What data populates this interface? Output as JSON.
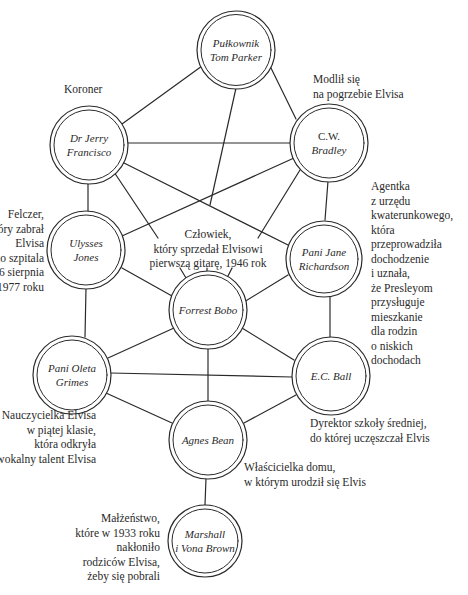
{
  "diagram": {
    "type": "network",
    "style": "hand-drawn double-circle nodes",
    "line_color": "#2a2a2a",
    "background": "#ffffff"
  },
  "nodes": {
    "parker": {
      "line1": "Pułkownik",
      "line2": "Tom Parker"
    },
    "francisco": {
      "line1": "Dr Jerry",
      "line2": "Francisco"
    },
    "bradley": {
      "line1": "C.W.",
      "line2": "Bradley"
    },
    "jones": {
      "line1": "Ulysses",
      "line2": "Jones"
    },
    "richardson": {
      "line1": "Pani Jane",
      "line2": "Richardson"
    },
    "bobo": {
      "line1": "Forrest Bobo"
    },
    "grimes": {
      "line1": "Pani Oleta",
      "line2": "Grimes"
    },
    "ball": {
      "line1": "E.C. Ball"
    },
    "bean": {
      "line1": "Agnes Bean"
    },
    "brown": {
      "line1": "Marshall",
      "line2": "i Vona Brown"
    }
  },
  "annotations": {
    "francisco": [
      "Koroner"
    ],
    "bradley": [
      "Modlił się",
      "na pogrzebie Elvisa"
    ],
    "richardson": [
      "Agentka",
      "z urzędu",
      "kwaterunkowego,",
      "która",
      "przeprowadziła",
      "dochodzenie",
      "i uznała,",
      "że Presleyom",
      "przysługuje",
      "mieszkanie",
      "dla rodzin",
      "o niskich",
      "dochodach"
    ],
    "jones": [
      "Felczer,",
      "który zabrał",
      "Elvisa",
      "do szpitala",
      "16 sierpnia",
      "1977 roku"
    ],
    "bobo": [
      "Człowiek,",
      "który sprzedał Elvisowi",
      "pierwszą gitarę, 1946 rok"
    ],
    "grimes": [
      "Nauczycielka Elvisa",
      "w piątej klasie,",
      "która odkryła",
      "wokalny talent Elvisa"
    ],
    "ball": [
      "Dyrektor szkoły średniej,",
      "do której uczęszczał Elvis"
    ],
    "bean": [
      "Właścicielka domu,",
      "w którym urodził się Elvis"
    ],
    "brown": [
      "Małżeństwo,",
      "które w 1933 roku",
      "nakłoniło",
      "rodziców Elvisa,",
      "żeby się pobrali"
    ]
  },
  "edges": [
    [
      "parker",
      "francisco"
    ],
    [
      "parker",
      "bradley"
    ],
    [
      "parker",
      "bobo"
    ],
    [
      "francisco",
      "bradley"
    ],
    [
      "francisco",
      "jones"
    ],
    [
      "francisco",
      "richardson"
    ],
    [
      "francisco",
      "bobo"
    ],
    [
      "bradley",
      "jones"
    ],
    [
      "bradley",
      "richardson"
    ],
    [
      "bradley",
      "bobo"
    ],
    [
      "jones",
      "bobo"
    ],
    [
      "jones",
      "grimes"
    ],
    [
      "richardson",
      "bobo"
    ],
    [
      "richardson",
      "ball"
    ],
    [
      "bobo",
      "grimes"
    ],
    [
      "bobo",
      "ball"
    ],
    [
      "bobo",
      "bean"
    ],
    [
      "grimes",
      "ball"
    ],
    [
      "grimes",
      "bean"
    ],
    [
      "ball",
      "bean"
    ],
    [
      "bean",
      "brown"
    ]
  ]
}
